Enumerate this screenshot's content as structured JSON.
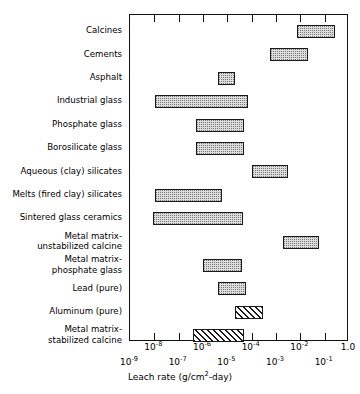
{
  "chart_data": {
    "type": "bar",
    "orientation": "horizontal",
    "title": "",
    "xlabel": "Leach rate (g/cm2-day)",
    "xlabel_parts": {
      "pre": "Leach rate (g/cm",
      "sup": "2",
      "post": "-day)"
    },
    "ylabel": "",
    "xscale": "log",
    "xlim": [
      1e-09,
      1.0
    ],
    "grid": false,
    "legend": false,
    "xticks": [
      1e-09,
      1e-08,
      1e-07,
      1e-06,
      1e-05,
      0.0001,
      0.001,
      0.01,
      0.1,
      1.0
    ],
    "xticklabels": [
      {
        "mantissa": "10",
        "exp": "-9",
        "row": "lower"
      },
      {
        "mantissa": "10",
        "exp": "-8",
        "row": "upper"
      },
      {
        "mantissa": "10",
        "exp": "-7",
        "row": "lower"
      },
      {
        "mantissa": "10",
        "exp": "-6",
        "row": "upper"
      },
      {
        "mantissa": "10",
        "exp": "-5",
        "row": "lower"
      },
      {
        "mantissa": "10",
        "exp": "-4",
        "row": "upper"
      },
      {
        "mantissa": "10",
        "exp": "-3",
        "row": "lower"
      },
      {
        "mantissa": "10",
        "exp": "-2",
        "row": "upper"
      },
      {
        "mantissa": "10",
        "exp": "-1",
        "row": "lower"
      },
      {
        "mantissa": "1.0",
        "exp": "",
        "row": "upper"
      }
    ],
    "categories": [
      "Calcines",
      "Cements",
      "Asphalt",
      "Industrial glass",
      "Phosphate glass",
      "Borosilicate glass",
      "Aqueous (clay) silicates",
      "Melts (fired clay) silicates",
      "Sintered glass ceramics",
      "Metal matrix-\nunstabilized calcine",
      "Metal matrix-\nphosphate glass",
      "Lead (pure)",
      "Aluminum (pure)",
      "Metal matrix-\nstabilized calcine"
    ],
    "bars": [
      {
        "label": "Calcines",
        "low": 0.0076,
        "high": 0.26,
        "pattern": "dot"
      },
      {
        "label": "Cements",
        "low": 0.00057,
        "high": 0.02,
        "pattern": "dot"
      },
      {
        "label": "Asphalt",
        "low": 4e-06,
        "high": 2e-05,
        "pattern": "dot"
      },
      {
        "label": "Industrial glass",
        "low": 1.1e-08,
        "high": 7e-05,
        "pattern": "dot"
      },
      {
        "label": "Phosphate glass",
        "low": 5e-07,
        "high": 5e-05,
        "pattern": "dot"
      },
      {
        "label": "Borosilicate glass",
        "low": 5e-07,
        "high": 5e-05,
        "pattern": "dot"
      },
      {
        "label": "Aqueous (clay) silicates",
        "low": 0.0001,
        "high": 0.003,
        "pattern": "dot"
      },
      {
        "label": "Melts (fired clay) silicates",
        "low": 1.1e-08,
        "high": 6e-06,
        "pattern": "dot"
      },
      {
        "label": "Sintered glass ceramics",
        "low": 9e-09,
        "high": 4.5e-05,
        "pattern": "dot"
      },
      {
        "label": "Metal matrix-unstabilized calcine",
        "low": 0.002,
        "high": 0.06,
        "pattern": "dot"
      },
      {
        "label": "Metal matrix-phosphate glass",
        "low": 1e-06,
        "high": 4e-05,
        "pattern": "dot"
      },
      {
        "label": "Lead (pure)",
        "low": 4e-06,
        "high": 6e-05,
        "pattern": "dot"
      },
      {
        "label": "Aluminum (pure)",
        "low": 2e-05,
        "high": 0.0003,
        "pattern": "hatch"
      },
      {
        "label": "Metal matrix-stabilized calcine",
        "low": 4e-07,
        "high": 5e-05,
        "pattern": "hatch"
      }
    ]
  }
}
